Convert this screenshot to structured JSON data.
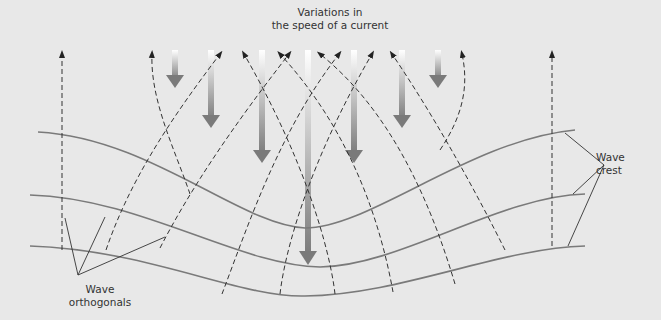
{
  "title": {
    "line1": "Variations in",
    "line2": "the speed of a current"
  },
  "labels": {
    "orthogonals_line1": "Wave",
    "orthogonals_line2": "orthogonals",
    "crest_line1": "Wave",
    "crest_line2": "crest"
  },
  "colors": {
    "background": "#e8e8e8",
    "crest_line": "#7a7a7a",
    "orthogonal_line": "#333333",
    "current_arrow_dark": "#7a7a7a",
    "current_arrow_light": "#ffffff",
    "text": "#333333"
  },
  "diagram": {
    "current_arrows": [
      {
        "x": 175,
        "y_start": 50,
        "y_end": 87
      },
      {
        "x": 211,
        "y_start": 50,
        "y_end": 127
      },
      {
        "x": 262,
        "y_start": 50,
        "y_end": 162
      },
      {
        "x": 308,
        "y_start": 50,
        "y_end": 264
      },
      {
        "x": 354,
        "y_start": 50,
        "y_end": 162
      },
      {
        "x": 402,
        "y_start": 50,
        "y_end": 127
      },
      {
        "x": 438,
        "y_start": 50,
        "y_end": 87
      }
    ],
    "wave_crests": 3
  }
}
